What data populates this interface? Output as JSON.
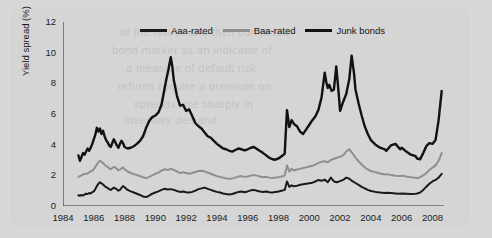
{
  "figure": {
    "background_color": "#d8d8d8",
    "panel_color": "#d5d5d5",
    "bleed_through_lines": [
      "of the issuer and then computed",
      "bond market as an indicator of",
      "a measure of default risk",
      "returns require a premium on",
      "spreads rise sharply in",
      "investors demand"
    ]
  },
  "chart_data": {
    "type": "line",
    "title": "",
    "subtitle": "",
    "xlabel": "",
    "ylabel": "Yield spread (%)",
    "xlim": [
      1984,
      2008.75
    ],
    "ylim": [
      0,
      12
    ],
    "xticks": [
      1984,
      1986,
      1988,
      1990,
      1992,
      1994,
      1996,
      1998,
      2000,
      2002,
      2004,
      2006,
      2008
    ],
    "yticks": [
      0,
      2,
      4,
      6,
      8,
      10,
      12
    ],
    "grid": false,
    "legend_position": "top-center",
    "colors": {
      "aaa": "#1a1a1a",
      "baa": "#8f8f8f",
      "junk": "#111111",
      "axis": "#333333",
      "text": "#1c1c1c"
    },
    "series": [
      {
        "name": "Aaa-rated",
        "color": "#1a1a1a",
        "width": 2.0,
        "x": [
          1985.0,
          1985.1,
          1985.2,
          1985.3,
          1985.4,
          1985.5,
          1985.6,
          1985.7,
          1985.8,
          1985.9,
          1986.0,
          1986.1,
          1986.2,
          1986.3,
          1986.4,
          1986.5,
          1986.6,
          1986.7,
          1986.8,
          1986.9,
          1987.0,
          1987.1,
          1987.2,
          1987.3,
          1987.4,
          1987.5,
          1987.6,
          1987.7,
          1987.8,
          1987.9,
          1988.0,
          1988.2,
          1988.4,
          1988.6,
          1988.8,
          1989.0,
          1989.2,
          1989.4,
          1989.6,
          1989.8,
          1990.0,
          1990.2,
          1990.4,
          1990.6,
          1990.8,
          1991.0,
          1991.2,
          1991.4,
          1991.6,
          1991.8,
          1992.0,
          1992.2,
          1992.4,
          1992.6,
          1992.8,
          1993.0,
          1993.2,
          1993.4,
          1993.6,
          1993.8,
          1994.0,
          1994.2,
          1994.4,
          1994.6,
          1994.8,
          1995.0,
          1995.2,
          1995.4,
          1995.6,
          1995.8,
          1996.0,
          1996.2,
          1996.4,
          1996.6,
          1996.8,
          1997.0,
          1997.2,
          1997.4,
          1997.6,
          1997.8,
          1998.0,
          1998.2,
          1998.4,
          1998.55,
          1998.7,
          1998.85,
          1999.0,
          1999.2,
          1999.4,
          1999.6,
          1999.8,
          2000.0,
          2000.2,
          2000.4,
          2000.6,
          2000.8,
          2001.0,
          2001.2,
          2001.4,
          2001.6,
          2001.8,
          2002.0,
          2002.2,
          2002.4,
          2002.6,
          2002.8,
          2003.0,
          2003.2,
          2003.4,
          2003.6,
          2003.8,
          2004.0,
          2004.3,
          2004.6,
          2004.9,
          2005.0,
          2005.3,
          2005.6,
          2005.9,
          2006.0,
          2006.3,
          2006.6,
          2006.9,
          2007.0,
          2007.2,
          2007.4,
          2007.6,
          2007.8,
          2008.0,
          2008.2,
          2008.4,
          2008.6
        ],
        "y": [
          0.7,
          0.66,
          0.72,
          0.68,
          0.75,
          0.8,
          0.78,
          0.85,
          0.82,
          0.9,
          0.95,
          1.1,
          1.3,
          1.45,
          1.55,
          1.48,
          1.4,
          1.3,
          1.22,
          1.18,
          1.1,
          1.05,
          1.12,
          1.2,
          1.15,
          1.08,
          1.0,
          1.05,
          1.18,
          1.3,
          1.22,
          1.05,
          0.95,
          0.88,
          0.8,
          0.72,
          0.62,
          0.58,
          0.68,
          0.8,
          0.88,
          0.95,
          1.05,
          1.12,
          1.08,
          1.1,
          1.05,
          0.98,
          0.92,
          0.95,
          0.9,
          0.88,
          0.92,
          1.0,
          1.1,
          1.15,
          1.2,
          1.12,
          1.05,
          0.98,
          0.92,
          0.88,
          0.82,
          0.78,
          0.75,
          0.78,
          0.85,
          0.92,
          0.95,
          0.9,
          0.95,
          1.02,
          1.05,
          1.0,
          0.95,
          0.92,
          0.95,
          0.9,
          0.88,
          0.92,
          0.95,
          1.0,
          1.05,
          1.6,
          1.25,
          1.35,
          1.28,
          1.32,
          1.38,
          1.42,
          1.45,
          1.48,
          1.52,
          1.6,
          1.7,
          1.65,
          1.72,
          1.55,
          1.85,
          1.6,
          1.55,
          1.62,
          1.7,
          1.85,
          1.78,
          1.62,
          1.5,
          1.38,
          1.25,
          1.15,
          1.05,
          0.98,
          0.92,
          0.88,
          0.85,
          0.86,
          0.84,
          0.82,
          0.8,
          0.82,
          0.8,
          0.78,
          0.8,
          0.82,
          0.88,
          1.05,
          1.25,
          1.45,
          1.6,
          1.7,
          1.85,
          2.1
        ]
      },
      {
        "name": "Baa-rated",
        "color": "#8f8f8f",
        "width": 2.0,
        "x": [
          1985.0,
          1985.1,
          1985.2,
          1985.3,
          1985.4,
          1985.5,
          1985.6,
          1985.7,
          1985.8,
          1985.9,
          1986.0,
          1986.1,
          1986.2,
          1986.3,
          1986.4,
          1986.5,
          1986.6,
          1986.7,
          1986.8,
          1986.9,
          1987.0,
          1987.1,
          1987.2,
          1987.3,
          1987.4,
          1987.5,
          1987.6,
          1987.7,
          1987.8,
          1987.9,
          1988.0,
          1988.2,
          1988.4,
          1988.6,
          1988.8,
          1989.0,
          1989.2,
          1989.4,
          1989.6,
          1989.8,
          1990.0,
          1990.2,
          1990.4,
          1990.6,
          1990.8,
          1991.0,
          1991.2,
          1991.4,
          1991.6,
          1991.8,
          1992.0,
          1992.2,
          1992.4,
          1992.6,
          1992.8,
          1993.0,
          1993.2,
          1993.4,
          1993.6,
          1993.8,
          1994.0,
          1994.2,
          1994.4,
          1994.6,
          1994.8,
          1995.0,
          1995.2,
          1995.4,
          1995.6,
          1995.8,
          1996.0,
          1996.2,
          1996.4,
          1996.6,
          1996.8,
          1997.0,
          1997.2,
          1997.4,
          1997.6,
          1997.8,
          1998.0,
          1998.2,
          1998.4,
          1998.55,
          1998.7,
          1998.85,
          1999.0,
          1999.2,
          1999.4,
          1999.6,
          1999.8,
          2000.0,
          2000.2,
          2000.4,
          2000.6,
          2000.8,
          2001.0,
          2001.2,
          2001.4,
          2001.6,
          2001.8,
          2002.0,
          2002.2,
          2002.4,
          2002.6,
          2002.8,
          2003.0,
          2003.2,
          2003.4,
          2003.6,
          2003.8,
          2004.0,
          2004.3,
          2004.6,
          2004.9,
          2005.0,
          2005.3,
          2005.6,
          2005.9,
          2006.0,
          2006.3,
          2006.6,
          2006.9,
          2007.0,
          2007.2,
          2007.4,
          2007.6,
          2007.8,
          2008.0,
          2008.2,
          2008.4,
          2008.6
        ],
        "y": [
          1.9,
          1.95,
          2.0,
          2.05,
          2.1,
          2.08,
          2.12,
          2.2,
          2.25,
          2.3,
          2.4,
          2.55,
          2.7,
          2.85,
          2.95,
          2.88,
          2.8,
          2.7,
          2.6,
          2.55,
          2.45,
          2.4,
          2.48,
          2.55,
          2.5,
          2.42,
          2.32,
          2.38,
          2.45,
          2.52,
          2.4,
          2.25,
          2.15,
          2.08,
          2.02,
          1.95,
          1.88,
          1.82,
          1.9,
          2.0,
          2.1,
          2.18,
          2.3,
          2.4,
          2.35,
          2.42,
          2.35,
          2.25,
          2.15,
          2.2,
          2.15,
          2.1,
          2.15,
          2.22,
          2.28,
          2.3,
          2.25,
          2.18,
          2.1,
          2.02,
          1.95,
          1.9,
          1.85,
          1.8,
          1.78,
          1.8,
          1.85,
          1.92,
          1.95,
          1.9,
          1.92,
          1.98,
          2.02,
          1.98,
          1.92,
          1.88,
          1.9,
          1.85,
          1.82,
          1.86,
          1.88,
          1.92,
          1.98,
          2.65,
          2.25,
          2.42,
          2.32,
          2.38,
          2.42,
          2.48,
          2.52,
          2.58,
          2.62,
          2.7,
          2.82,
          2.88,
          2.92,
          2.85,
          3.0,
          3.08,
          3.15,
          3.22,
          3.3,
          3.55,
          3.7,
          3.45,
          3.15,
          2.92,
          2.7,
          2.52,
          2.38,
          2.28,
          2.2,
          2.12,
          2.05,
          2.08,
          2.02,
          1.98,
          1.95,
          1.98,
          1.92,
          1.88,
          1.85,
          1.82,
          1.88,
          2.0,
          2.15,
          2.35,
          2.5,
          2.65,
          2.95,
          3.45
        ]
      },
      {
        "name": "Junk bonds",
        "color": "#111111",
        "width": 2.4,
        "x": [
          1985.0,
          1985.1,
          1985.2,
          1985.3,
          1985.4,
          1985.5,
          1985.6,
          1985.7,
          1985.8,
          1985.9,
          1986.0,
          1986.1,
          1986.2,
          1986.3,
          1986.4,
          1986.5,
          1986.6,
          1986.7,
          1986.8,
          1986.9,
          1987.0,
          1987.1,
          1987.2,
          1987.3,
          1987.4,
          1987.5,
          1987.6,
          1987.7,
          1987.8,
          1987.9,
          1988.0,
          1988.2,
          1988.4,
          1988.6,
          1988.8,
          1989.0,
          1989.2,
          1989.4,
          1989.6,
          1989.8,
          1990.0,
          1990.2,
          1990.4,
          1990.55,
          1990.7,
          1990.85,
          1991.0,
          1991.1,
          1991.2,
          1991.4,
          1991.6,
          1991.8,
          1992.0,
          1992.2,
          1992.4,
          1992.6,
          1992.8,
          1993.0,
          1993.2,
          1993.4,
          1993.6,
          1993.8,
          1994.0,
          1994.2,
          1994.4,
          1994.6,
          1994.8,
          1995.0,
          1995.2,
          1995.4,
          1995.6,
          1995.8,
          1996.0,
          1996.2,
          1996.4,
          1996.6,
          1996.8,
          1997.0,
          1997.2,
          1997.4,
          1997.6,
          1997.8,
          1998.0,
          1998.2,
          1998.4,
          1998.55,
          1998.7,
          1998.85,
          1999.0,
          1999.2,
          1999.4,
          1999.6,
          1999.8,
          2000.0,
          2000.2,
          2000.4,
          2000.6,
          2000.8,
          2001.0,
          2001.1,
          2001.2,
          2001.3,
          2001.45,
          2001.6,
          2001.75,
          2001.9,
          2002.0,
          2002.2,
          2002.4,
          2002.6,
          2002.75,
          2002.9,
          2003.0,
          2003.2,
          2003.4,
          2003.6,
          2003.8,
          2004.0,
          2004.3,
          2004.6,
          2004.9,
          2005.0,
          2005.3,
          2005.6,
          2005.9,
          2006.0,
          2006.3,
          2006.6,
          2006.9,
          2007.0,
          2007.2,
          2007.4,
          2007.6,
          2007.8,
          2008.0,
          2008.2,
          2008.4,
          2008.6
        ],
        "y": [
          3.3,
          2.95,
          3.2,
          3.45,
          3.35,
          3.55,
          3.75,
          3.6,
          3.8,
          4.05,
          4.35,
          4.65,
          5.1,
          4.85,
          5.05,
          4.7,
          4.9,
          4.55,
          4.3,
          4.15,
          3.95,
          3.85,
          4.1,
          4.35,
          4.15,
          3.95,
          3.8,
          4.05,
          4.25,
          4.1,
          3.85,
          3.75,
          3.8,
          3.9,
          4.05,
          4.25,
          4.55,
          5.1,
          5.55,
          5.8,
          5.9,
          6.1,
          6.6,
          7.4,
          8.2,
          8.9,
          9.7,
          9.1,
          8.2,
          7.2,
          6.55,
          6.6,
          6.2,
          6.3,
          5.85,
          5.4,
          5.2,
          5.05,
          4.8,
          4.55,
          4.45,
          4.25,
          4.05,
          3.9,
          3.75,
          3.7,
          3.6,
          3.55,
          3.65,
          3.75,
          3.7,
          3.62,
          3.7,
          3.8,
          3.85,
          3.72,
          3.58,
          3.45,
          3.3,
          3.15,
          3.05,
          3.02,
          3.1,
          3.25,
          3.4,
          6.25,
          5.15,
          5.6,
          5.35,
          5.2,
          4.85,
          4.7,
          5.0,
          5.3,
          5.6,
          5.85,
          6.3,
          7.1,
          8.7,
          8.1,
          7.7,
          7.9,
          7.5,
          7.6,
          9.1,
          7.45,
          6.2,
          6.8,
          7.3,
          8.3,
          9.8,
          8.7,
          7.6,
          6.7,
          5.9,
          5.2,
          4.7,
          4.3,
          4.0,
          3.8,
          3.7,
          3.6,
          3.95,
          4.05,
          3.7,
          3.8,
          3.55,
          3.35,
          3.25,
          3.1,
          3.05,
          3.45,
          3.9,
          4.1,
          4.05,
          4.3,
          5.6,
          7.5
        ]
      }
    ]
  },
  "legend": {
    "items": [
      {
        "label": "Aaa-rated",
        "color": "#1a1a1a",
        "thickness": "3px"
      },
      {
        "label": "Baa-rated",
        "color": "#8f8f8f",
        "thickness": "3px"
      },
      {
        "label": "Junk bonds",
        "color": "#111111",
        "thickness": "3.5px"
      }
    ]
  }
}
